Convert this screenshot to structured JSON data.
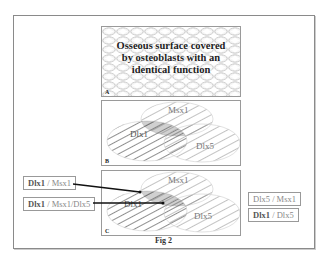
{
  "figure": {
    "caption": "Fig 2",
    "panels": [
      {
        "id": "A",
        "label": "A",
        "text_lines": [
          "Osseous surface covered",
          "by osteoblasts with an",
          "identical function"
        ]
      },
      {
        "id": "B",
        "label": "B",
        "genes": [
          "Msx1",
          "Dlx1",
          "Dlx5"
        ]
      },
      {
        "id": "C",
        "label": "C",
        "genes": [
          "Msx1",
          "Dlx1",
          "Dlx5"
        ]
      }
    ],
    "left_labels": [
      {
        "bold": "Dlx1",
        "sep": " / ",
        "rest": "Msx1"
      },
      {
        "bold": "Dlx1",
        "sep": " / ",
        "rest": "Msx1/Dlx5"
      }
    ],
    "right_labels": [
      {
        "bold": "",
        "sep": "",
        "rest": "Dlx5 / Msx1"
      },
      {
        "bold": "Dlx1",
        "sep": " / ",
        "rest": "Dlx5"
      }
    ]
  }
}
